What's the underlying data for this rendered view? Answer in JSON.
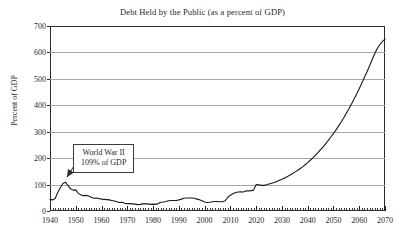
{
  "chart_data": {
    "type": "line",
    "title": "Debt Held by the Public (as a percent of GDP)",
    "xlabel": "",
    "ylabel": "Percent of GDP",
    "xlim": [
      1940,
      2070
    ],
    "ylim": [
      0,
      700
    ],
    "ytick_labels": [
      "0",
      "100",
      "200",
      "300",
      "400",
      "500",
      "600",
      "700"
    ],
    "yticks": [
      0,
      100,
      200,
      300,
      400,
      500,
      600,
      700
    ],
    "xtick_labels": [
      "1940",
      "1950",
      "1960",
      "1970",
      "1980",
      "1990",
      "2000",
      "2010",
      "2020",
      "2030",
      "2040",
      "2050",
      "2060",
      "2070"
    ],
    "xticks": [
      1940,
      1950,
      1960,
      1970,
      1980,
      1990,
      2000,
      2010,
      2020,
      2030,
      2040,
      2050,
      2060,
      2070
    ],
    "grid": "horizontal",
    "legend": "none",
    "minor_tick_interval": 1,
    "line_color": "#1a1a1a",
    "grid_color": "#a6a6a6",
    "axis_color": "#2a2a2a",
    "background_color": "#ffffff",
    "annotations": [
      {
        "line1": "World War II",
        "line2": "109% of GDP",
        "points_to_x": 1946,
        "points_to_y": 109
      }
    ],
    "x": [
      1940,
      1941,
      1942,
      1943,
      1944,
      1945,
      1946,
      1947,
      1948,
      1949,
      1950,
      1951,
      1952,
      1953,
      1954,
      1955,
      1956,
      1957,
      1958,
      1959,
      1960,
      1961,
      1962,
      1963,
      1964,
      1965,
      1966,
      1967,
      1968,
      1969,
      1970,
      1971,
      1972,
      1973,
      1974,
      1975,
      1976,
      1977,
      1978,
      1979,
      1980,
      1981,
      1982,
      1983,
      1984,
      1985,
      1986,
      1987,
      1988,
      1989,
      1990,
      1991,
      1992,
      1993,
      1994,
      1995,
      1996,
      1997,
      1998,
      1999,
      2000,
      2001,
      2002,
      2003,
      2004,
      2005,
      2006,
      2007,
      2008,
      2009,
      2010,
      2011,
      2012,
      2013,
      2014,
      2015,
      2016,
      2017,
      2018,
      2019,
      2020,
      2021,
      2022,
      2023,
      2024,
      2025,
      2026,
      2027,
      2028,
      2029,
      2030,
      2031,
      2032,
      2033,
      2034,
      2035,
      2036,
      2037,
      2038,
      2039,
      2040,
      2041,
      2042,
      2043,
      2044,
      2045,
      2046,
      2047,
      2048,
      2049,
      2050,
      2051,
      2052,
      2053,
      2054,
      2055,
      2056,
      2057,
      2058,
      2059,
      2060,
      2061,
      2062,
      2063,
      2064,
      2065,
      2066,
      2067,
      2068,
      2069,
      2070
    ],
    "values": [
      44,
      42,
      47,
      70,
      88,
      104,
      109,
      96,
      84,
      79,
      80,
      66,
      61,
      58,
      59,
      57,
      52,
      48,
      49,
      47,
      45,
      44,
      43,
      42,
      40,
      38,
      35,
      32,
      33,
      29,
      28,
      28,
      27,
      26,
      24,
      25,
      27,
      27,
      27,
      25,
      26,
      25,
      28,
      33,
      34,
      36,
      39,
      40,
      40,
      40,
      42,
      45,
      48,
      49,
      49,
      49,
      48,
      45,
      43,
      39,
      34,
      32,
      33,
      35,
      36,
      36,
      35,
      35,
      39,
      52,
      60,
      65,
      70,
      72,
      73,
      72,
      76,
      76,
      77,
      79,
      100,
      99,
      97,
      97,
      99,
      102,
      105,
      108,
      112,
      116,
      120,
      125,
      130,
      135,
      141,
      147,
      153,
      160,
      167,
      175,
      183,
      192,
      201,
      211,
      221,
      232,
      243,
      255,
      267,
      280,
      293,
      307,
      322,
      337,
      353,
      370,
      387,
      405,
      424,
      443,
      463,
      484,
      505,
      527,
      549,
      572,
      595,
      615,
      630,
      642,
      650
    ]
  }
}
